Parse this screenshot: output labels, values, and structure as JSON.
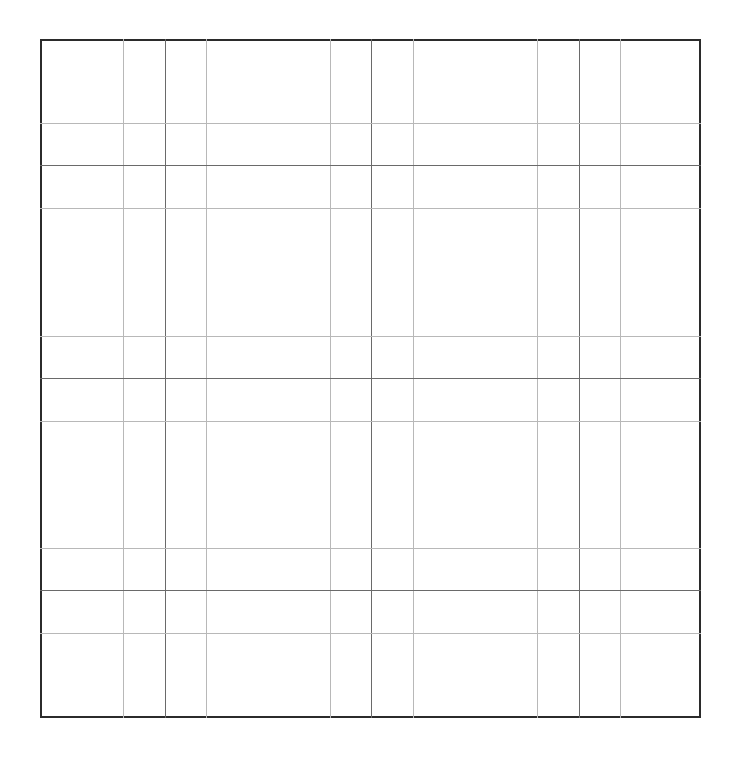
{
  "grid": {
    "frame": {
      "left": 40,
      "top": 39,
      "right": 701,
      "bottom": 718,
      "border_color": "#2b2b2b"
    },
    "vertical_lines": [
      {
        "x": 123,
        "weight": "light"
      },
      {
        "x": 165,
        "weight": "dark"
      },
      {
        "x": 206,
        "weight": "light"
      },
      {
        "x": 330,
        "weight": "light"
      },
      {
        "x": 371,
        "weight": "dark"
      },
      {
        "x": 413,
        "weight": "light"
      },
      {
        "x": 537,
        "weight": "light"
      },
      {
        "x": 579,
        "weight": "dark"
      },
      {
        "x": 620,
        "weight": "light"
      }
    ],
    "horizontal_lines": [
      {
        "y": 123,
        "weight": "light"
      },
      {
        "y": 165,
        "weight": "dark"
      },
      {
        "y": 208,
        "weight": "light"
      },
      {
        "y": 336,
        "weight": "light"
      },
      {
        "y": 378,
        "weight": "dark"
      },
      {
        "y": 421,
        "weight": "light"
      },
      {
        "y": 548,
        "weight": "light"
      },
      {
        "y": 590,
        "weight": "dark"
      },
      {
        "y": 633,
        "weight": "light"
      }
    ],
    "colors": {
      "light": "#b8b8b8",
      "dark": "#6a6a6a"
    }
  }
}
